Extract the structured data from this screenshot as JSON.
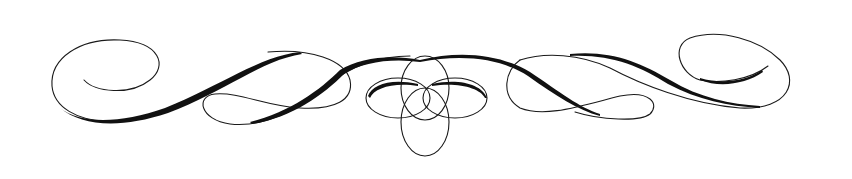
{
  "image": {
    "description": "Decorative calligraphic flourish divider",
    "colors": {
      "ink": "#111111",
      "background": "#ffffff"
    }
  }
}
